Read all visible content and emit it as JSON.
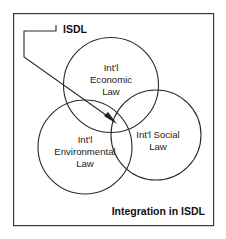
{
  "diagram": {
    "title_label": "ISDL",
    "caption": "Integration in ISDL",
    "frame": {
      "x": 13,
      "y": 13,
      "width": 201,
      "height": 213
    },
    "colors": {
      "background": "#ffffff",
      "stroke": "#2b2b2b",
      "frame_stroke": "#3a3a3a",
      "text": "#1a1a1a",
      "arrow_fill": "#1f1f1f"
    },
    "circles": [
      {
        "name": "international-economic-law",
        "cx": 111,
        "cy": 85,
        "r": 47.5,
        "lines": [
          "Int'l",
          "Economic",
          "Law"
        ],
        "label_x": 111,
        "label_y": 71
      },
      {
        "name": "international-environmental-law",
        "cx": 85,
        "cy": 147,
        "r": 47,
        "lines": [
          "Int'l",
          "Environmental",
          "Law"
        ],
        "label_x": 85,
        "label_y": 143
      },
      {
        "name": "international-social-law",
        "cx": 156,
        "cy": 135,
        "r": 45,
        "lines": [
          "Int'l Social",
          "Law"
        ],
        "label_x": 158,
        "label_y": 138
      }
    ],
    "leader": {
      "name": "isdl-pointer",
      "path": "M 56 25 L 56 31 L 24 31 L 24 57 L 113 120",
      "arrow_points": "117,124 104,116 108,112"
    },
    "title_position": {
      "x": 63,
      "y": 33
    },
    "caption_position": {
      "x": 205,
      "y": 215
    }
  }
}
